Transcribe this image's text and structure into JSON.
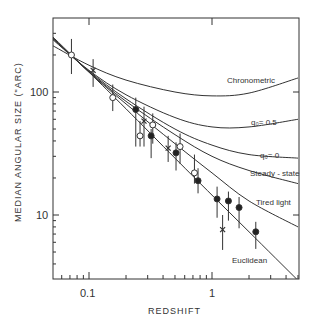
{
  "chart_data": {
    "type": "scatter",
    "title": "",
    "xlabel": "REDSHIFT",
    "ylabel": "MEDIAN ANGULAR SIZE (\"ARC)",
    "xscale": "log",
    "yscale": "log",
    "xlim": [
      0.051,
      5.1
    ],
    "ylim": [
      3.0,
      400
    ],
    "grid": false,
    "x_tick_labels": [
      "0.1",
      "1"
    ],
    "y_tick_labels": [
      "100",
      "10"
    ],
    "curves": [
      {
        "name": "Chronometric",
        "label": "Chronometric",
        "x": [
          0.05,
          0.1,
          0.2,
          0.5,
          1,
          2,
          5
        ],
        "y": [
          240,
          165,
          125,
          100,
          93,
          98,
          130
        ]
      },
      {
        "name": "q0=0.5",
        "label": "q₀ = 0.5",
        "x": [
          0.05,
          0.1,
          0.2,
          0.5,
          1,
          2,
          5
        ],
        "y": [
          270,
          150,
          95,
          62,
          52,
          52,
          60
        ]
      },
      {
        "name": "q0=0",
        "label": "q₀ = 0",
        "x": [
          0.05,
          0.1,
          0.2,
          0.5,
          1,
          2,
          5
        ],
        "y": [
          275,
          148,
          88,
          50,
          37,
          31,
          29
        ]
      },
      {
        "name": "Steady-state",
        "label": "Steady-state",
        "x": [
          0.05,
          0.1,
          0.2,
          0.5,
          1,
          2,
          5
        ],
        "y": [
          278,
          146,
          84,
          45,
          30,
          23,
          18
        ]
      },
      {
        "name": "Tired light",
        "label": "Tired light",
        "x": [
          0.05,
          0.1,
          0.2,
          0.5,
          1,
          2,
          5
        ],
        "y": [
          280,
          145,
          80,
          38,
          22,
          13,
          8
        ]
      },
      {
        "name": "Euclidean",
        "label": "Euclidean",
        "x": [
          0.05,
          0.1,
          0.2,
          0.5,
          1,
          2,
          4.9
        ],
        "y": [
          285,
          145,
          73,
          29,
          14.5,
          7.3,
          3.0
        ]
      }
    ],
    "series": [
      {
        "name": "open circles",
        "marker": "open-circle",
        "points": [
          {
            "x": 0.072,
            "y": 200,
            "lo": 140,
            "hi": 270
          },
          {
            "x": 0.156,
            "y": 90,
            "lo": 70,
            "hi": 115
          },
          {
            "x": 0.26,
            "y": 44,
            "lo": 36,
            "hi": 58
          },
          {
            "x": 0.33,
            "y": 54,
            "lo": 38,
            "hi": 67
          },
          {
            "x": 0.55,
            "y": 36,
            "lo": 26,
            "hi": 46
          },
          {
            "x": 0.72,
            "y": 22,
            "lo": 18,
            "hi": 31
          }
        ]
      },
      {
        "name": "filled circles",
        "marker": "filled-circle",
        "points": [
          {
            "x": 0.24,
            "y": 72,
            "lo": 36,
            "hi": 90
          },
          {
            "x": 0.32,
            "y": 44,
            "lo": 29,
            "hi": 50
          },
          {
            "x": 0.51,
            "y": 32,
            "lo": 23,
            "hi": 39
          },
          {
            "x": 0.77,
            "y": 19,
            "lo": 15,
            "hi": 24
          },
          {
            "x": 1.1,
            "y": 13.5,
            "lo": 9.5,
            "hi": 17
          },
          {
            "x": 1.36,
            "y": 13,
            "lo": 9,
            "hi": 15.5
          },
          {
            "x": 1.66,
            "y": 11.5,
            "lo": 7.8,
            "hi": 14
          },
          {
            "x": 2.27,
            "y": 7.3,
            "lo": 5.3,
            "hi": 8.8
          }
        ]
      },
      {
        "name": "crosses",
        "marker": "cross",
        "points": [
          {
            "x": 0.108,
            "y": 150,
            "lo": 110,
            "hi": 185
          },
          {
            "x": 0.28,
            "y": 58,
            "lo": 36,
            "hi": 76
          },
          {
            "x": 0.44,
            "y": 35,
            "lo": 27,
            "hi": 44
          },
          {
            "x": 1.22,
            "y": 7.6,
            "lo": 5.2,
            "hi": 10
          }
        ]
      }
    ]
  },
  "labels": {
    "xlabel": "REDSHIFT",
    "ylabel": "MEDIAN ANGULAR SIZE (\"ARC)",
    "xtick_0_1": "0.1",
    "xtick_1": "1",
    "ytick_100": "100",
    "ytick_10": "10",
    "chronometric": "Chronometric",
    "q05": "q₀= 0.5",
    "q0": "q₀= 0",
    "steady": "Steady - state",
    "tired": "Tired light",
    "euclid": "Euclidean"
  }
}
